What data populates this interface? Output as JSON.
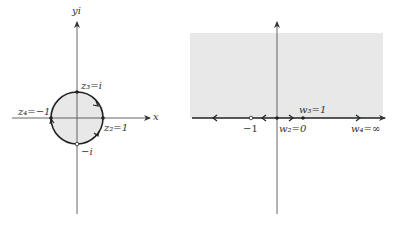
{
  "left_plane": {
    "y_axis_label": "yi",
    "x_axis_label": "x",
    "points": [
      {
        "name": "z3",
        "label": "z₃=i"
      },
      {
        "name": "z2",
        "label": "z₂=1"
      },
      {
        "name": "z4",
        "label": "z₄=−1"
      },
      {
        "name": "minus_i",
        "label": "−i"
      }
    ],
    "region": "unit disk (shaded)"
  },
  "right_plane": {
    "points": [
      {
        "name": "w3",
        "label": "w₃=1"
      },
      {
        "name": "w2",
        "label": "w₂=0"
      },
      {
        "name": "w4",
        "label": "w₄=∞"
      },
      {
        "name": "minus_one",
        "label": "−1"
      }
    ],
    "region": "upper half-plane (shaded)"
  },
  "colors": {
    "shade": "#e8e8e8",
    "line": "#222222",
    "axis": "#555555"
  }
}
